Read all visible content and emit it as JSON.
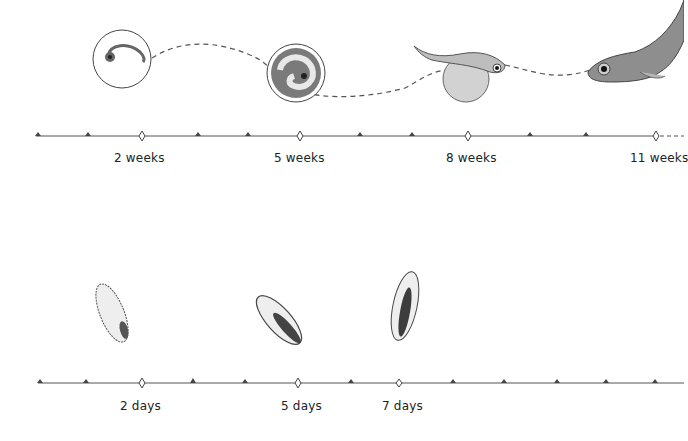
{
  "diagram": {
    "title": "",
    "colors": {
      "ink": "#3a3a3a",
      "fill_light": "#e6e6e6",
      "fill_dark": "#555555",
      "background": "#ffffff"
    }
  },
  "timeline_weeks": {
    "unit": "weeks",
    "markers": [
      {
        "label": "2 weeks",
        "x": 142
      },
      {
        "label": "5 weeks",
        "x": 300
      },
      {
        "label": "8 weeks",
        "x": 468
      },
      {
        "label": "11 weeks",
        "x": 656
      }
    ],
    "stages": [
      {
        "name": "embryo in egg (early)",
        "label_ref": "2 weeks"
      },
      {
        "name": "embryo curled in egg",
        "label_ref": "5 weeks"
      },
      {
        "name": "larva with yolk sac",
        "label_ref": "8 weeks"
      },
      {
        "name": "juvenile fish",
        "label_ref": "11 weeks"
      }
    ]
  },
  "timeline_days": {
    "unit": "days",
    "markers": [
      {
        "label": "2 days",
        "x": 142
      },
      {
        "label": "5 days",
        "x": 298
      },
      {
        "label": "7 days",
        "x": 399
      }
    ],
    "stages": [
      {
        "name": "larva stage 1",
        "label_ref": "2 days"
      },
      {
        "name": "larva stage 2",
        "label_ref": "5 days"
      },
      {
        "name": "larva stage 3",
        "label_ref": "7 days"
      }
    ]
  }
}
